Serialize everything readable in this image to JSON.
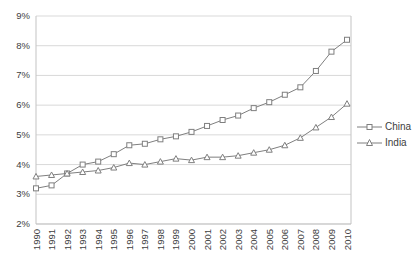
{
  "chart_data": {
    "type": "line",
    "title": "",
    "categories": [
      "1990",
      "1991",
      "1992",
      "1993",
      "1994",
      "1995",
      "1996",
      "1997",
      "1998",
      "1999",
      "2000",
      "2001",
      "2002",
      "2003",
      "2004",
      "2005",
      "2006",
      "2007",
      "2008",
      "2009",
      "2010"
    ],
    "series": [
      {
        "name": "China",
        "marker": "square",
        "color": "#7f7f7f",
        "values": [
          3.2,
          3.3,
          3.7,
          4.0,
          4.1,
          4.35,
          4.65,
          4.7,
          4.85,
          4.95,
          5.1,
          5.3,
          5.5,
          5.65,
          5.9,
          6.1,
          6.35,
          6.6,
          7.15,
          7.8,
          8.2
        ]
      },
      {
        "name": "India",
        "marker": "triangle",
        "color": "#7f7f7f",
        "values": [
          3.6,
          3.65,
          3.7,
          3.75,
          3.8,
          3.9,
          4.05,
          4.0,
          4.1,
          4.2,
          4.15,
          4.25,
          4.25,
          4.3,
          4.4,
          4.5,
          4.65,
          4.9,
          5.25,
          5.6,
          6.05
        ]
      }
    ],
    "xlabel": "",
    "ylabel": "",
    "ylim": [
      2,
      9
    ],
    "ytick_labels": [
      "2%",
      "3%",
      "4%",
      "5%",
      "6%",
      "7%",
      "8%",
      "9%"
    ],
    "x_tick_rotation": -90,
    "grid": "horizontal",
    "legend_position": "right",
    "colors": {
      "grid": "#d9d9d9",
      "axis": "#c3c3c3",
      "text": "#404040",
      "marker_fill": "#ffffff",
      "background": "#ffffff"
    }
  }
}
